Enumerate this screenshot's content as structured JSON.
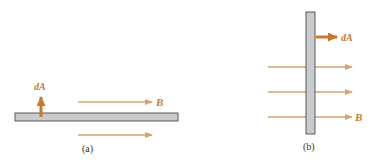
{
  "colors": {
    "arrow": "#d9a272",
    "arrow_thick": "#c8792f",
    "label": "#c8792f",
    "plate_fill": "#c9cbcc",
    "plate_stroke": "#4a4a4a",
    "caption": "#333333"
  },
  "panel_a": {
    "caption": "(a)",
    "normal_label": "dA",
    "field_label": "B",
    "description": "Horizontal plate with area vector dA pointing up, field B parallel to the plate"
  },
  "panel_b": {
    "caption": "(b)",
    "normal_label": "dA",
    "field_label": "B",
    "description": "Vertical plate with area vector dA pointing right, field B perpendicular to the plate"
  }
}
